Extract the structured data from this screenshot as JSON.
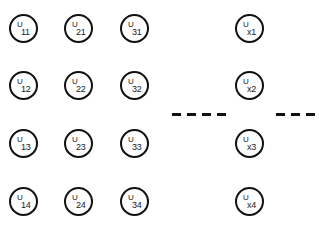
{
  "diagram": {
    "columns": [
      {
        "nodes": [
          {
            "base": "U",
            "sub": "11"
          },
          {
            "base": "U",
            "sub": "12"
          },
          {
            "base": "U",
            "sub": "13"
          },
          {
            "base": "U",
            "sub": "14"
          }
        ]
      },
      {
        "nodes": [
          {
            "base": "U",
            "sub": "21"
          },
          {
            "base": "U",
            "sub": "22"
          },
          {
            "base": "U",
            "sub": "23"
          },
          {
            "base": "U",
            "sub": "24"
          }
        ]
      },
      {
        "nodes": [
          {
            "base": "U",
            "sub": "31"
          },
          {
            "base": "U",
            "sub": "32"
          },
          {
            "base": "U",
            "sub": "33"
          },
          {
            "base": "U",
            "sub": "34"
          }
        ]
      },
      {
        "nodes": [
          {
            "base": "U",
            "sub": "x1"
          },
          {
            "base": "U",
            "sub": "x2"
          },
          {
            "base": "U",
            "sub": "x3"
          },
          {
            "base": "U",
            "sub": "x4"
          }
        ]
      }
    ],
    "ellipsis_groups": [
      {
        "dash_count": 4
      },
      {
        "dash_count": 3
      }
    ],
    "colors": {
      "stroke": "#111111",
      "text": "#222222",
      "background": "#ffffff"
    }
  }
}
